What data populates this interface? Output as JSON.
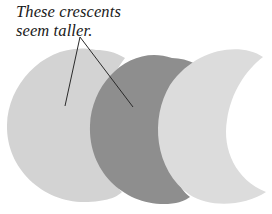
{
  "caption": {
    "line1": "These crescents",
    "line2": "seem taller."
  },
  "shapes": {
    "left_crescent": {
      "fill": "#d3d3d3",
      "label": "light-gray crescent"
    },
    "middle_crescent": {
      "fill": "#8e8e8e",
      "label": "dark-gray crescent"
    },
    "right_crescent": {
      "fill": "#dcdcdc",
      "label": "light-gray crescent"
    }
  },
  "annotation": {
    "stroke": "#2a2a2a",
    "origin": [
      80,
      37
    ],
    "targets": [
      [
        65,
        106
      ],
      [
        133,
        107
      ]
    ]
  }
}
